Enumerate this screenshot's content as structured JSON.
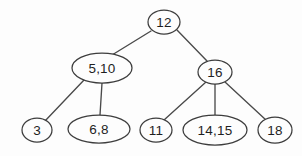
{
  "figure": {
    "name": "b-tree-diagram",
    "background_color": "#fdfdfd",
    "node_fill": "#fdfdfd",
    "node_stroke": "#3d3d3d",
    "edge_color": "#4a4a4a",
    "text_color": "#1f1f1f",
    "width": 302,
    "height": 156
  },
  "chart_data": {
    "type": "diagram",
    "diagram_kind": "b-tree",
    "title": "",
    "nodes": [
      {
        "id": "root",
        "label": "12",
        "cx": 164,
        "cy": 22,
        "rx": 16,
        "ry": 12,
        "level": 0
      },
      {
        "id": "n510",
        "label": "5,10",
        "cx": 102,
        "cy": 68,
        "rx": 30,
        "ry": 15,
        "level": 1
      },
      {
        "id": "n16",
        "label": "16",
        "cx": 215,
        "cy": 72,
        "rx": 17,
        "ry": 12,
        "level": 1
      },
      {
        "id": "n3",
        "label": "3",
        "cx": 37,
        "cy": 130,
        "rx": 15,
        "ry": 12,
        "level": 2
      },
      {
        "id": "n68",
        "label": "6,8",
        "cx": 99,
        "cy": 129,
        "rx": 31,
        "ry": 14,
        "level": 2
      },
      {
        "id": "n11",
        "label": "11",
        "cx": 156,
        "cy": 130,
        "rx": 16,
        "ry": 12,
        "level": 2
      },
      {
        "id": "n1415",
        "label": "14,15",
        "cx": 215,
        "cy": 130,
        "rx": 32,
        "ry": 15,
        "level": 2
      },
      {
        "id": "n18",
        "label": "18",
        "cx": 275,
        "cy": 130,
        "rx": 17,
        "ry": 13,
        "level": 2
      }
    ],
    "edges": [
      {
        "from": "root",
        "to": "n510",
        "x1": 151,
        "y1": 31,
        "x2": 112,
        "y2": 55
      },
      {
        "from": "root",
        "to": "n16",
        "x1": 177,
        "y1": 30,
        "x2": 207,
        "y2": 61
      },
      {
        "from": "n510",
        "to": "n3",
        "x1": 84,
        "y1": 80,
        "x2": 45,
        "y2": 121
      },
      {
        "from": "n510",
        "to": "n68",
        "x1": 102,
        "y1": 83,
        "x2": 100,
        "y2": 115
      },
      {
        "from": "n16",
        "to": "n11",
        "x1": 206,
        "y1": 82,
        "x2": 164,
        "y2": 120
      },
      {
        "from": "n16",
        "to": "n1415",
        "x1": 215,
        "y1": 84,
        "x2": 215,
        "y2": 115
      },
      {
        "from": "n16",
        "to": "n18",
        "x1": 225,
        "y1": 82,
        "x2": 266,
        "y2": 120
      }
    ]
  }
}
